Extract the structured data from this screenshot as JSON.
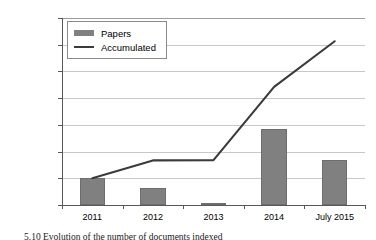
{
  "chart_data": {
    "type": "bar",
    "title": "",
    "subtitle": "",
    "xlabel": "",
    "ylabel": "",
    "categories": [
      "2011",
      "2012",
      "2013",
      "2014",
      "July 2015"
    ],
    "ylim": [
      0,
      7000000
    ],
    "ytick_labels": [
      "7,000,000",
      "6,000,000",
      "5,000,000",
      "4,000,000",
      "3,000,000",
      "2,000,000",
      "1,000,000",
      "0"
    ],
    "ytick_values": [
      7000000,
      6000000,
      5000000,
      4000000,
      3000000,
      2000000,
      1000000,
      0
    ],
    "grid": true,
    "legend_position": "upper-left-inside",
    "series": [
      {
        "name": "Papers",
        "type": "bar",
        "color": "#808080",
        "values": [
          1000000,
          620000,
          30000,
          2830000,
          1700000
        ]
      },
      {
        "name": "Accumulated",
        "type": "line",
        "color": "#3b3b3b",
        "values": [
          1000000,
          1670000,
          1680000,
          4420000,
          6130000
        ]
      }
    ]
  },
  "legend": {
    "items": [
      {
        "label": "Papers",
        "marker": "bar-swatch"
      },
      {
        "label": "Accumulated",
        "marker": "line-swatch"
      }
    ]
  },
  "caption": {
    "text": "5.10 Evolution of the number of documents indexed"
  }
}
